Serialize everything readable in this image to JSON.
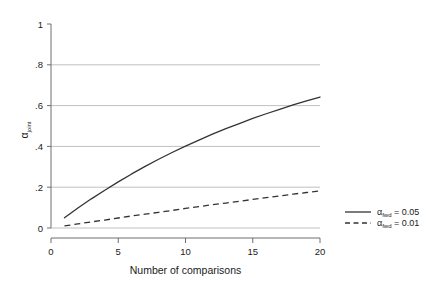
{
  "chart_data": {
    "type": "line",
    "title": "",
    "subtitle": "",
    "xlabel": "Number of comparisons",
    "ylabel": "αjoint",
    "ylabel_base": "α",
    "ylabel_sub": "joint",
    "xlim": [
      0,
      20
    ],
    "ylim": [
      0,
      1
    ],
    "grid": "horizontal",
    "legend_position": "right",
    "xticks": [
      0,
      5,
      10,
      15,
      20
    ],
    "xtick_labels": [
      "0",
      "5",
      "10",
      "15",
      "20"
    ],
    "yticks": [
      0,
      0.2,
      0.4,
      0.6,
      0.8,
      1
    ],
    "ytick_labels": [
      "0",
      ".2",
      ".4",
      ".6",
      ".8",
      "1"
    ],
    "x": [
      1,
      2,
      3,
      4,
      5,
      6,
      7,
      8,
      9,
      10,
      11,
      12,
      13,
      14,
      15,
      16,
      17,
      18,
      19,
      20
    ],
    "series": [
      {
        "name": "αfwd = 0.05",
        "name_base": "α",
        "name_sub": "fwd",
        "name_value": "= 0.05",
        "style": "solid",
        "color": "#333333",
        "values": [
          0.05,
          0.098,
          0.143,
          0.185,
          0.226,
          0.265,
          0.302,
          0.337,
          0.37,
          0.401,
          0.431,
          0.46,
          0.487,
          0.512,
          0.537,
          0.56,
          0.582,
          0.603,
          0.623,
          0.642
        ]
      },
      {
        "name": "αfwd = 0.01",
        "name_base": "α",
        "name_sub": "fwd",
        "name_value": "= 0.01",
        "style": "dashed",
        "color": "#333333",
        "values": [
          0.01,
          0.02,
          0.03,
          0.039,
          0.049,
          0.059,
          0.068,
          0.077,
          0.086,
          0.096,
          0.105,
          0.114,
          0.122,
          0.131,
          0.14,
          0.149,
          0.157,
          0.166,
          0.174,
          0.182
        ]
      }
    ]
  },
  "legend": {
    "entries": [
      {
        "label": "αfwd = 0.05",
        "base": "α",
        "sub": "fwd",
        "rest": " = 0.05",
        "style": "solid"
      },
      {
        "label": "αfwd = 0.01",
        "base": "α",
        "sub": "fwd",
        "rest": " = 0.01",
        "style": "dashed"
      }
    ]
  },
  "axes": {
    "x_title": "Number of comparisons",
    "y_title_base": "α",
    "y_title_sub": "joint",
    "x_tick_0": "0",
    "x_tick_1": "5",
    "x_tick_2": "10",
    "x_tick_3": "15",
    "x_tick_4": "20",
    "y_tick_0": "0",
    "y_tick_1": ".2",
    "y_tick_2": ".4",
    "y_tick_3": ".6",
    "y_tick_4": ".8",
    "y_tick_5": "1"
  },
  "colors": {
    "background": "#ffffff",
    "axis": "#6e6e6e",
    "grid": "#b0b0b0",
    "line": "#333333",
    "text": "#1a1a1a"
  }
}
